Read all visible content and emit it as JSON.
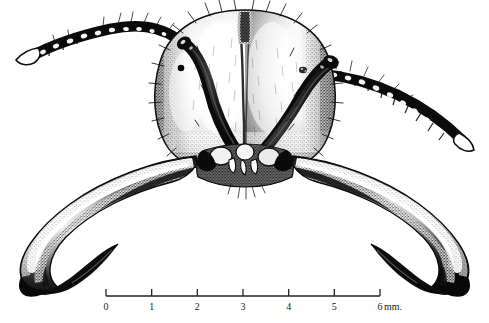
{
  "figure": {
    "kind": "scientific-illustration",
    "medium": "stipple-ink-drawing",
    "background_color": "#ffffff",
    "ink_color": "#111111",
    "width": 489,
    "height": 323,
    "caption": ""
  },
  "scale_bar": {
    "unit_label": "mm.",
    "tick_labels": [
      "0",
      "1",
      "2",
      "3",
      "4",
      "5",
      "6"
    ],
    "tick_values": [
      0,
      1,
      2,
      3,
      4,
      5,
      6
    ],
    "bar_start_x": 106,
    "bar_end_x": 380,
    "bar_y": 296,
    "tick_height": 7,
    "label_y": 302,
    "unit_x": 384,
    "line_color": "#222222"
  },
  "anatomy": {
    "parts": [
      {
        "name": "head-capsule",
        "label": "Head capsule",
        "shading": "stipple",
        "center_x": 245,
        "center_y": 88,
        "width": 160,
        "height": 150
      },
      {
        "name": "median-sulcus",
        "label": "Median frontal sulcus",
        "center_x": 245,
        "top_y": 12,
        "bottom_y": 150
      },
      {
        "name": "compound-eye-left",
        "label": "Left compound eye",
        "x": 181,
        "y": 68,
        "r": 3.2
      },
      {
        "name": "compound-eye-right",
        "label": "Right compound eye",
        "x": 303,
        "y": 70,
        "r": 3.0
      },
      {
        "name": "scape-left",
        "label": "Left antennal scape"
      },
      {
        "name": "scape-right",
        "label": "Right antennal scape"
      },
      {
        "name": "funiculus-left",
        "label": "Left antennal funiculus",
        "segment_count": 11
      },
      {
        "name": "funiculus-right",
        "label": "Right antennal funiculus",
        "segment_count": 11
      },
      {
        "name": "mandible-left",
        "label": "Left mandible (sickle-shaped)"
      },
      {
        "name": "mandible-right",
        "label": "Right mandible (sickle-shaped)"
      },
      {
        "name": "clypeus",
        "label": "Clypeus / mouthparts",
        "center_x": 245,
        "center_y": 160
      }
    ]
  }
}
